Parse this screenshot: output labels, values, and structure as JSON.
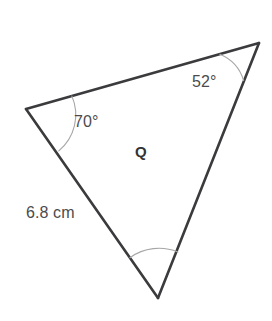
{
  "figure": {
    "type": "triangle-diagram",
    "region_label": "Q",
    "background_color": "#ffffff",
    "edge_color": "#3b3b3d",
    "arc_color": "#a6a6a6",
    "text_color": "#4b4b4d",
    "vertices": [
      {
        "name": "left-vertex",
        "x": 26,
        "y": 109
      },
      {
        "name": "top-right-vertex",
        "x": 259,
        "y": 43
      },
      {
        "name": "bottom-vertex",
        "x": 158,
        "y": 298
      }
    ],
    "angles": [
      {
        "name": "angle-at-left-vertex",
        "label": "70°",
        "value": 70,
        "labeled": true
      },
      {
        "name": "angle-at-top-right-vertex",
        "label": "52°",
        "value": 52,
        "labeled": true
      },
      {
        "name": "angle-at-bottom-vertex",
        "label": "",
        "value": 58,
        "labeled": false
      }
    ],
    "sides": [
      {
        "name": "left-side",
        "label": "6.8 cm",
        "length": 6.8,
        "unit": "cm",
        "labeled": true
      },
      {
        "name": "top-side",
        "label": "",
        "labeled": false
      },
      {
        "name": "right-side",
        "label": "",
        "labeled": false
      }
    ]
  },
  "labels": {
    "angle_70": "70°",
    "angle_52": "52°",
    "side_left": "6.8 cm",
    "region": "Q"
  }
}
